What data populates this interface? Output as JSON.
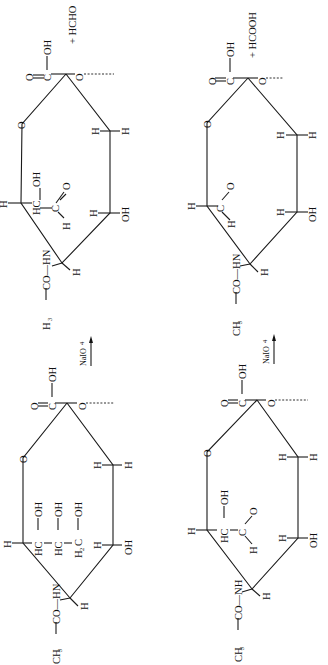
{
  "figure": {
    "orientation": "rotated-90-ccw",
    "colors": {
      "ink": "#111111",
      "background": "#ffffff"
    }
  },
  "reactions": [
    {
      "reactant": {
        "id": "triol-sialic-acid",
        "substituents": {
          "acetamido": "CH3CO—HN",
          "ring_oxygen": "O",
          "carboxyl": {
            "c": "C",
            "oxo": "O",
            "oh": "OH"
          },
          "glycosidic_o": "O",
          "side_chain": [
            "HC—OH",
            "HC—OH",
            "H2C—OH"
          ],
          "ring_h_labels": [
            "H",
            "H",
            "H",
            "H",
            "H"
          ],
          "ring_oh": "OH"
        }
      },
      "reagent": "NaIO4",
      "product": {
        "id": "aldehyde-c8",
        "substituents": {
          "acetamido": "H3CO—HN",
          "ring_oxygen": "O",
          "carboxyl": {
            "c": "C",
            "oxo": "O",
            "oh": "OH"
          },
          "glycosidic_o": "O",
          "side_chain": [
            "HC—OH",
            "C=O",
            "H"
          ],
          "ring_h_labels": [
            "H",
            "H",
            "H",
            "H",
            "H"
          ],
          "ring_oh": "OH"
        },
        "byproduct": "+ HCHO"
      }
    },
    {
      "reactant": {
        "id": "diol-sialic-acid",
        "substituents": {
          "acetamido": "CH3CO—NH",
          "ring_oxygen": "O",
          "carboxyl": {
            "c": "C",
            "oxo": "O",
            "oh": "OH"
          },
          "glycosidic_o": "O",
          "side_chain": [
            "HC—OH",
            "C=O",
            "H"
          ],
          "ring_h_labels": [
            "H",
            "H",
            "H",
            "H",
            "H"
          ],
          "ring_oh": "OH"
        }
      },
      "reagent": "NaIO4",
      "product": {
        "id": "aldehyde-c7",
        "substituents": {
          "acetamido": "CH3CO—HN",
          "ring_oxygen": "O",
          "carboxyl": {
            "c": "C",
            "oxo": "O",
            "oh": "OH"
          },
          "glycosidic_o": "O",
          "side_chain": [
            "C=O",
            "H"
          ],
          "ring_h_labels": [
            "H",
            "H",
            "H",
            "H",
            "H"
          ],
          "ring_oh": "OH"
        },
        "byproduct": "+ HCOOH"
      }
    }
  ],
  "labels": {
    "H": "H",
    "O": "O",
    "C": "C",
    "OH": "OH",
    "HC": "HC",
    "H2C": "H",
    "two": "2",
    "three": "3",
    "four": "4",
    "reagent_left": "NaIO",
    "reagent_right": "NaIO",
    "byproduct_left": "+ HCHO",
    "byproduct_right": "+ HCOOH",
    "nh_left_top": "H",
    "amide_left_top": "H",
    "amide_left_top_rest": "CO—HN",
    "amide_right_top": "CH",
    "amide_right_top_rest": "CO—HN",
    "amide_left_bottom": "CH",
    "amide_left_bottom_rest": "CO—HN",
    "amide_right_bottom": "CH",
    "amide_right_bottom_rest": "CO—NH"
  }
}
